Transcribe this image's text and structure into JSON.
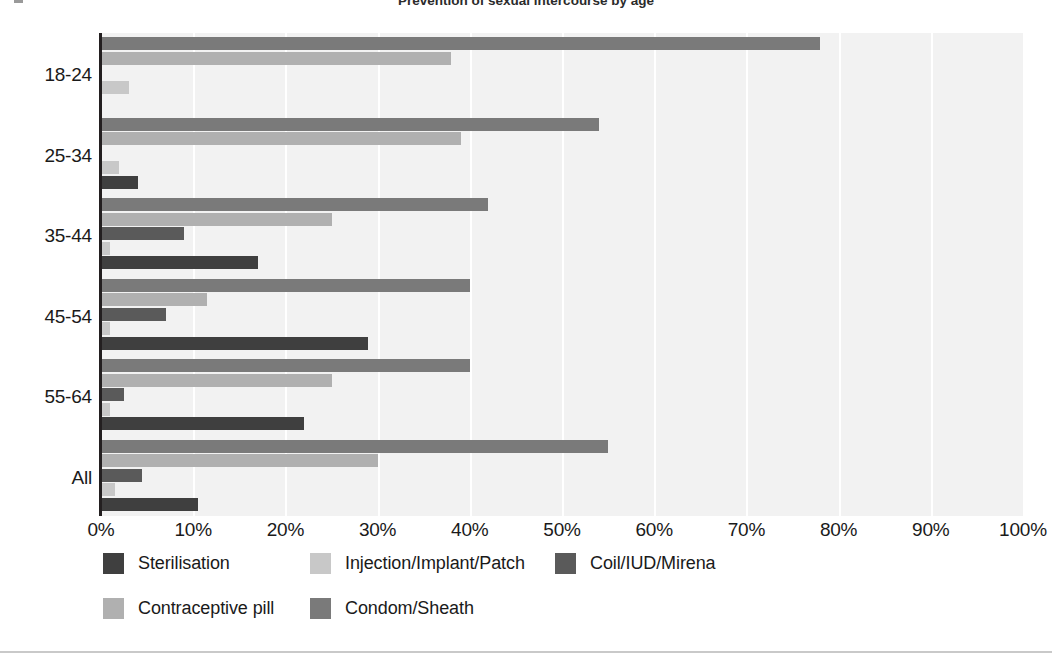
{
  "chart_data": {
    "type": "bar",
    "orientation": "horizontal",
    "title": "Prevention of sexual intercourse by age",
    "xlabel": "",
    "ylabel": "",
    "xlim": [
      0,
      100
    ],
    "xtick_labels": [
      "0%",
      "10%",
      "20%",
      "30%",
      "40%",
      "50%",
      "60%",
      "70%",
      "80%",
      "90%",
      "100%"
    ],
    "xtick_values": [
      0,
      10,
      20,
      30,
      40,
      50,
      60,
      70,
      80,
      90,
      100
    ],
    "categories": [
      "18-24",
      "25-34",
      "35-44",
      "45-54",
      "55-64",
      "All"
    ],
    "grid": "vertical",
    "legend_position": "bottom-left",
    "series": [
      {
        "name": "Sterilisation",
        "color": "#3f3f3f",
        "values": [
          0,
          4,
          17,
          29,
          22,
          10.5
        ]
      },
      {
        "name": "Injection/Implant/Patch",
        "color": "#c8c8c8",
        "values": [
          3,
          2,
          1,
          1,
          1,
          1.5
        ]
      },
      {
        "name": "Coil/IUD/Mirena",
        "color": "#5a5a5a",
        "values": [
          0,
          0,
          9,
          7,
          2.5,
          4.5
        ]
      },
      {
        "name": "Contraceptive pill",
        "color": "#b0b0b0",
        "values": [
          38,
          39,
          25,
          11.5,
          25,
          30
        ]
      },
      {
        "name": "Condom/Sheath",
        "color": "#7a7a7a",
        "values": [
          78,
          54,
          42,
          40,
          40,
          55
        ]
      }
    ],
    "series_draw_order": [
      "Condom/Sheath",
      "Contraceptive pill",
      "Coil/IUD/Mirena",
      "Injection/Implant/Patch",
      "Sterilisation"
    ],
    "plot_background": "#f2f2f2",
    "gridline_color": "#ffffff",
    "axis_color": "#231f20"
  },
  "legend": {
    "items": [
      {
        "label": "Sterilisation",
        "color": "#3f3f3f",
        "row": 0,
        "col": 0
      },
      {
        "label": "Injection/Implant/Patch",
        "color": "#c8c8c8",
        "row": 0,
        "col": 1
      },
      {
        "label": "Coil/IUD/Mirena",
        "color": "#5a5a5a",
        "row": 0,
        "col": 2
      },
      {
        "label": "Contraceptive pill",
        "color": "#b0b0b0",
        "row": 1,
        "col": 0
      },
      {
        "label": "Condom/Sheath",
        "color": "#7a7a7a",
        "row": 1,
        "col": 1
      }
    ]
  },
  "title": {
    "text": "Prevention of sexual intercourse by age"
  }
}
